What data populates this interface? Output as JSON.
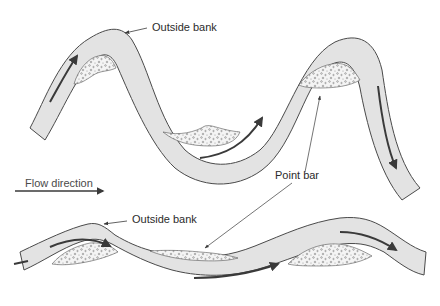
{
  "diagram": {
    "colors": {
      "channel_fill": "#e3e3e3",
      "channel_outline": "#4a4a4a",
      "arrow": "#3a3a3a",
      "point_bar_fill": "#f4f4f4",
      "point_bar_dots": "#7a7a7a",
      "text": "#2b2b2b"
    },
    "labels": {
      "outside_bank_upper": "Outside bank",
      "outside_bank_lower": "Outside bank",
      "point_bar": "Point bar",
      "flow_direction": "Flow direction"
    },
    "channels": [
      {
        "name": "upper-meander",
        "description": "Strongly sinuous channel with two bends and three point bars"
      },
      {
        "name": "lower-meander",
        "description": "Gently sinuous channel with two bends and two point bars"
      }
    ]
  }
}
